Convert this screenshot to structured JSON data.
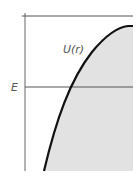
{
  "figure": {
    "curve_label": "U(r)",
    "energy_label": "E",
    "colors": {
      "curve": "#111111",
      "axis": "#555555",
      "shade": "#e2e2e2",
      "label": "#555555"
    }
  }
}
